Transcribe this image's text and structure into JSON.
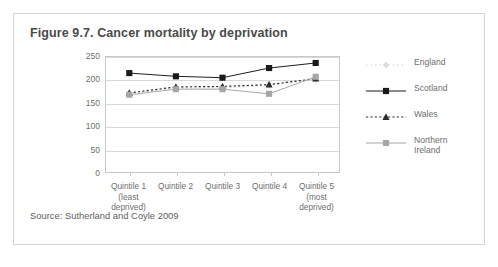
{
  "figure": {
    "title": "Figure 9.7. Cancer mortality by deprivation",
    "source": "Source: Sutherland and Coyle 2009"
  },
  "chart_data": {
    "type": "line",
    "title": "Figure 9.7. Cancer mortality by deprivation",
    "xlabel": "",
    "ylabel": "",
    "ylim": [
      0,
      250
    ],
    "yticks": [
      0,
      50,
      100,
      150,
      200,
      250
    ],
    "grid": true,
    "legend_position": "right",
    "categories": [
      "Quintile 1\n(least\ndeprived)",
      "Quintile 2",
      "Quintile 3",
      "Quintile 4",
      "Quintile 5\n(most\ndeprived)"
    ],
    "series": [
      {
        "name": "England",
        "values": [
          170,
          182,
          183,
          188,
          201
        ],
        "color": "#dcdcdc",
        "line_style": "dotted",
        "marker": "diamond"
      },
      {
        "name": "Scotland",
        "values": [
          215,
          208,
          205,
          226,
          237
        ],
        "color": "#1a1a1a",
        "line_style": "solid",
        "marker": "square"
      },
      {
        "name": "Wales",
        "values": [
          172,
          185,
          186,
          190,
          203
        ],
        "color": "#2e2e2e",
        "line_style": "dotted",
        "marker": "triangle"
      },
      {
        "name": "Northern Ireland",
        "values": [
          168,
          180,
          180,
          170,
          207
        ],
        "color": "#a6a6a6",
        "line_style": "solid",
        "marker": "square"
      }
    ]
  },
  "legend": {
    "items": [
      {
        "label": "England"
      },
      {
        "label": "Scotland"
      },
      {
        "label": "Wales"
      },
      {
        "label": "Northern\nIreland"
      }
    ]
  }
}
